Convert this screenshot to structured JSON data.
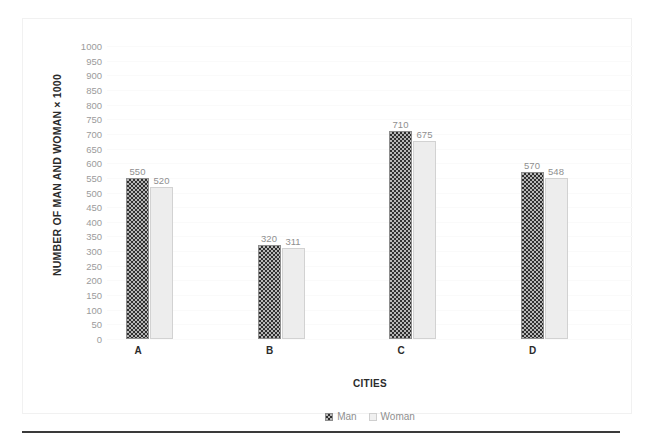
{
  "chart_data": {
    "type": "bar",
    "title": "",
    "xlabel": "CITIES",
    "ylabel": "NUMBER OF MAN AND WOMAN × 1000",
    "categories": [
      "A",
      "B",
      "C",
      "D"
    ],
    "series": [
      {
        "name": "Man",
        "values": [
          550,
          320,
          710,
          570
        ],
        "swatch": "checkered-dark",
        "color": "#2f2f2f"
      },
      {
        "name": "Woman",
        "values": [
          520,
          311,
          675,
          548
        ],
        "swatch": "light-solid",
        "color": "#ededed"
      }
    ],
    "ylim": [
      0,
      1000
    ],
    "ytick_step": 50,
    "yticks": [
      1000,
      950,
      900,
      850,
      800,
      750,
      700,
      650,
      600,
      550,
      500,
      450,
      400,
      350,
      300,
      250,
      200,
      150,
      100,
      50,
      0
    ],
    "grid": true,
    "grid_color": "#fafafa",
    "legend_position": "bottom",
    "data_labels": true,
    "data_label_color": "#8f8f8f",
    "tick_label_color": "#9b9b9b",
    "axis_title_color": "#2b2b2b",
    "frame_border_color": "#f1f1f1",
    "rule_color": "#3a3a3a",
    "background": "#ffffff"
  }
}
